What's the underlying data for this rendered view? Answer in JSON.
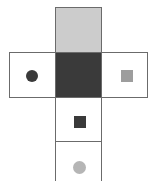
{
  "figure": {
    "name": "cube-net-cross-diagram",
    "type": "net-diagram",
    "width": 157,
    "height": 181,
    "background_color": "#ffffff",
    "border_color": "#6b6b6b",
    "border_width": 1,
    "cells": [
      {
        "id": "top-cell",
        "label": "",
        "position": "top",
        "fill_color": "#cccccc",
        "x": 55,
        "y": 7,
        "w": 47,
        "h": 45,
        "bordered": true,
        "marker": null
      },
      {
        "id": "left-cell",
        "label": "",
        "position": "left",
        "fill_color": "#ffffff",
        "x": 9,
        "y": 52,
        "w": 47,
        "h": 46,
        "bordered": true,
        "marker": {
          "shape": "circle",
          "color": "#3a3a3a",
          "size": 12,
          "cx": 32,
          "cy": 76
        }
      },
      {
        "id": "center-cell",
        "label": "",
        "position": "center",
        "fill_color": "#3a3a3a",
        "x": 55,
        "y": 52,
        "w": 47,
        "h": 46,
        "bordered": true,
        "marker": null
      },
      {
        "id": "right-cell",
        "label": "",
        "position": "right",
        "fill_color": "#ffffff",
        "x": 101,
        "y": 52,
        "w": 47,
        "h": 46,
        "bordered": true,
        "marker": {
          "shape": "square",
          "color": "#9d9d9d",
          "size": 12,
          "cx": 126,
          "cy": 76
        }
      },
      {
        "id": "lower-cell",
        "label": "",
        "position": "below-center",
        "fill_color": "#ffffff",
        "x": 55,
        "y": 98,
        "w": 47,
        "h": 44,
        "bordered": true,
        "marker": {
          "shape": "square",
          "color": "#3a3a3a",
          "size": 12,
          "cx": 79,
          "cy": 122
        }
      },
      {
        "id": "bottom-cell",
        "label": "",
        "position": "bottom",
        "fill_color": "#ffffff",
        "x": 55,
        "y": 141,
        "w": 47,
        "h": 44,
        "bordered": true,
        "marker": {
          "shape": "circle",
          "color": "#b5b5b5",
          "size": 13,
          "cx": 79,
          "cy": 167
        }
      }
    ]
  }
}
